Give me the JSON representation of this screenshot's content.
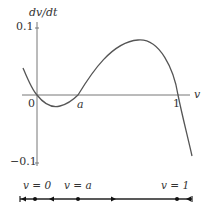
{
  "diagram": {
    "type": "phase-plot",
    "y_axis_label": "dv/dt",
    "x_axis_label": "v",
    "y_ticks": [
      "0.1",
      "−0.1"
    ],
    "x_labels": {
      "origin": "0",
      "a": "a",
      "one": "1"
    },
    "curve_description": "cubic dv/dt with roots at v=0, v=a, v=1; negative between 0 and a, positive between a and 1",
    "phase_line": {
      "labels": [
        "v = 0",
        "v = a",
        "v = 1"
      ],
      "equilibria": [
        "0",
        "a",
        "1"
      ],
      "arrows": [
        "left",
        "left",
        "right",
        "left"
      ]
    },
    "colors": {
      "curve": "#555555",
      "axis": "#666666",
      "phase_line": "#222222"
    }
  }
}
